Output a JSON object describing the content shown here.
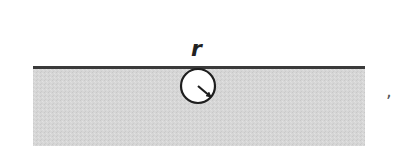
{
  "figure": {
    "type": "diagram",
    "labels": {
      "radius": "r",
      "trailing_mark": ","
    },
    "colors": {
      "medium_fill": "#d4d4d4",
      "surface_line": "#3a3a3a",
      "bubble_fill": "#ffffff",
      "bubble_stroke": "#1e1e1e",
      "background": "#ffffff"
    },
    "geometry": {
      "medium": {
        "x": 33,
        "y": 67,
        "width": 332,
        "height": 79
      },
      "surface_line": {
        "x1": 33,
        "x2": 365,
        "y": 67,
        "thickness": 3
      },
      "bubble": {
        "cx": 198,
        "cy": 86,
        "r": 17
      },
      "radius_arrow": {
        "x1": 198,
        "y1": 86,
        "x2": 211,
        "y2": 97
      }
    }
  }
}
